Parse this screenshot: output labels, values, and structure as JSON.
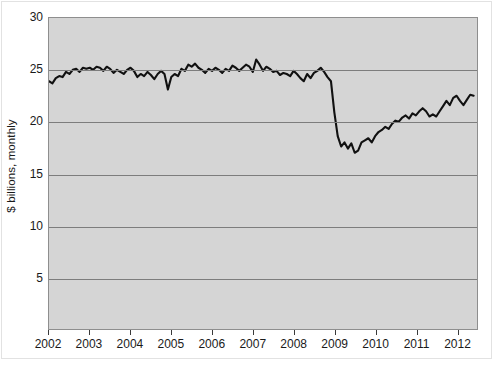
{
  "chart_data": {
    "type": "line",
    "title": "",
    "subtitle": "",
    "xlabel": "",
    "ylabel": "$ billions, monthly",
    "ylim": [
      0,
      30
    ],
    "yticks": [
      5,
      10,
      15,
      20,
      25,
      30
    ],
    "ytick_labels": [
      "5",
      "10",
      "15",
      "20",
      "25",
      "30"
    ],
    "xlim": [
      2002.0,
      2012.5
    ],
    "xticks": [
      2002,
      2003,
      2004,
      2005,
      2006,
      2007,
      2008,
      2009,
      2010,
      2011,
      2012
    ],
    "xtick_labels": [
      "2002",
      "2003",
      "2004",
      "2005",
      "2006",
      "2007",
      "2008",
      "2009",
      "2010",
      "2011",
      "2012"
    ],
    "grid": true,
    "grid_axis": "y",
    "legend": false,
    "legend_position": "none",
    "line_color": "#111111",
    "plot_background": "#d5d5d5",
    "grid_color": "#7d7d7d",
    "series": [
      {
        "name": "$ billions, monthly",
        "x": [
          2002.0,
          2002.083,
          2002.167,
          2002.25,
          2002.333,
          2002.417,
          2002.5,
          2002.583,
          2002.667,
          2002.75,
          2002.833,
          2002.917,
          2003.0,
          2003.083,
          2003.167,
          2003.25,
          2003.333,
          2003.417,
          2003.5,
          2003.583,
          2003.667,
          2003.75,
          2003.833,
          2003.917,
          2004.0,
          2004.083,
          2004.167,
          2004.25,
          2004.333,
          2004.417,
          2004.5,
          2004.583,
          2004.667,
          2004.75,
          2004.833,
          2004.917,
          2005.0,
          2005.083,
          2005.167,
          2005.25,
          2005.333,
          2005.417,
          2005.5,
          2005.583,
          2005.667,
          2005.75,
          2005.833,
          2005.917,
          2006.0,
          2006.083,
          2006.167,
          2006.25,
          2006.333,
          2006.417,
          2006.5,
          2006.583,
          2006.667,
          2006.75,
          2006.833,
          2006.917,
          2007.0,
          2007.083,
          2007.167,
          2007.25,
          2007.333,
          2007.417,
          2007.5,
          2007.583,
          2007.667,
          2007.75,
          2007.833,
          2007.917,
          2008.0,
          2008.083,
          2008.167,
          2008.25,
          2008.333,
          2008.417,
          2008.5,
          2008.583,
          2008.667,
          2008.75,
          2008.833,
          2008.917,
          2009.0,
          2009.083,
          2009.167,
          2009.25,
          2009.333,
          2009.417,
          2009.5,
          2009.583,
          2009.667,
          2009.75,
          2009.833,
          2009.917,
          2010.0,
          2010.083,
          2010.167,
          2010.25,
          2010.333,
          2010.417,
          2010.5,
          2010.583,
          2010.667,
          2010.75,
          2010.833,
          2010.917,
          2011.0,
          2011.083,
          2011.167,
          2011.25,
          2011.333,
          2011.417,
          2011.5,
          2011.583,
          2011.667,
          2011.75,
          2011.833,
          2011.917,
          2012.0,
          2012.083,
          2012.167,
          2012.25,
          2012.333,
          2012.417
        ],
        "values": [
          23.9,
          23.7,
          24.2,
          24.4,
          24.3,
          24.8,
          24.6,
          25.0,
          25.1,
          24.8,
          25.2,
          25.1,
          25.2,
          25.0,
          25.3,
          25.2,
          24.9,
          25.3,
          25.1,
          24.7,
          25.0,
          24.8,
          24.6,
          25.0,
          25.2,
          24.9,
          24.3,
          24.6,
          24.4,
          24.8,
          24.5,
          24.1,
          24.6,
          24.9,
          24.6,
          23.1,
          24.3,
          24.6,
          24.4,
          25.1,
          24.9,
          25.5,
          25.3,
          25.6,
          25.2,
          25.0,
          24.7,
          25.1,
          24.9,
          25.2,
          25.0,
          24.7,
          25.1,
          24.9,
          25.4,
          25.2,
          24.9,
          25.2,
          25.5,
          25.3,
          24.8,
          26.0,
          25.5,
          24.9,
          25.3,
          25.1,
          24.8,
          24.9,
          24.5,
          24.7,
          24.6,
          24.4,
          24.9,
          24.6,
          24.2,
          23.9,
          24.6,
          24.2,
          24.7,
          24.9,
          25.2,
          24.8,
          24.3,
          23.9,
          20.9,
          18.6,
          17.6,
          18.0,
          17.4,
          17.9,
          17.0,
          17.2,
          18.0,
          18.2,
          18.4,
          18.0,
          18.6,
          19.0,
          19.2,
          19.5,
          19.3,
          19.8,
          20.1,
          20.0,
          20.4,
          20.6,
          20.3,
          20.8,
          20.6,
          21.0,
          21.3,
          21.0,
          20.5,
          20.7,
          20.5,
          21.0,
          21.5,
          22.0,
          21.6,
          22.3,
          22.5,
          22.0,
          21.6,
          22.1,
          22.6,
          22.5
        ]
      }
    ]
  }
}
